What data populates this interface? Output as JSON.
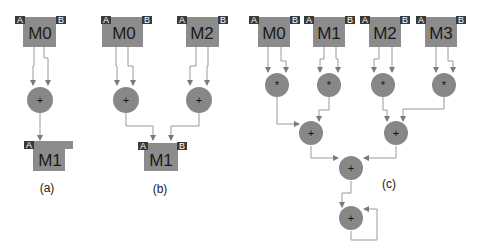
{
  "colors": {
    "module_fill": "#8c8c8c",
    "port_fill": "#3a3a3a",
    "operator_fill": "#878787",
    "wire": "#9a9a9a",
    "background": "#ffffff"
  },
  "panels": [
    {
      "caption": "(a)",
      "modules": [
        {
          "id": "a_m0",
          "label": "M0",
          "ports": [
            "A",
            "B"
          ]
        },
        {
          "id": "a_m1",
          "label": "M1",
          "ports": [
            "A"
          ]
        }
      ],
      "operators": [
        {
          "id": "a_add0",
          "symbol": "+"
        }
      ]
    },
    {
      "caption": "(b)",
      "modules": [
        {
          "id": "b_m0",
          "label": "M0",
          "ports": [
            "A",
            "B"
          ]
        },
        {
          "id": "b_m2",
          "label": "M2",
          "ports": [
            "A",
            "B"
          ]
        },
        {
          "id": "b_m1",
          "label": "M1",
          "ports": [
            "A",
            "B"
          ]
        }
      ],
      "operators": [
        {
          "id": "b_add0",
          "symbol": "+"
        },
        {
          "id": "b_add1",
          "symbol": "+"
        }
      ]
    },
    {
      "caption": "(c)",
      "modules": [
        {
          "id": "c_m0",
          "label": "M0",
          "ports": [
            "A",
            "B"
          ]
        },
        {
          "id": "c_m1",
          "label": "M1",
          "ports": [
            "A",
            "B"
          ]
        },
        {
          "id": "c_m2",
          "label": "M2",
          "ports": [
            "A",
            "B"
          ]
        },
        {
          "id": "c_m3",
          "label": "M3",
          "ports": [
            "A",
            "B"
          ]
        }
      ],
      "operators": [
        {
          "id": "c_mul0",
          "symbol": "*"
        },
        {
          "id": "c_mul1",
          "symbol": "*"
        },
        {
          "id": "c_mul2",
          "symbol": "*"
        },
        {
          "id": "c_mul3",
          "symbol": "*"
        },
        {
          "id": "c_add0",
          "symbol": "+"
        },
        {
          "id": "c_add1",
          "symbol": "+"
        },
        {
          "id": "c_add2",
          "symbol": "+"
        },
        {
          "id": "c_acc",
          "symbol": "+"
        }
      ]
    }
  ]
}
